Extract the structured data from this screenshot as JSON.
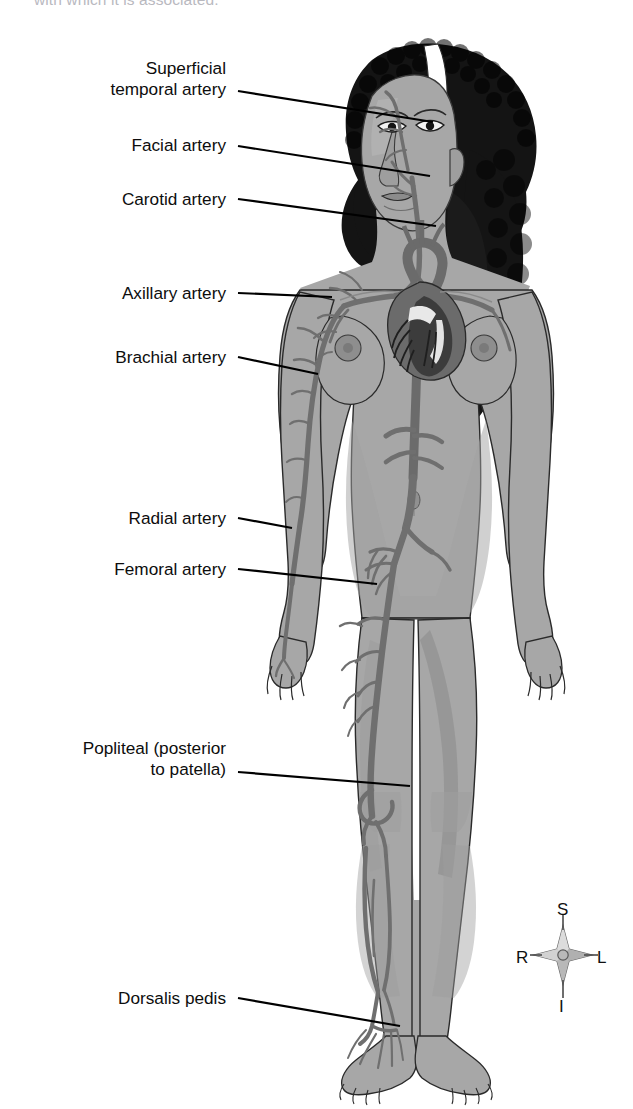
{
  "document": {
    "title": "Arterial pulse points of the body",
    "caption_fragment": "with which it is associated."
  },
  "figure": {
    "colors": {
      "background": "#ffffff",
      "skin": "#a7a7a7",
      "skin_shadow": "#8f8f8f",
      "skin_highlight": "#b6b6b6",
      "artery": "#6f6f6f",
      "artery_dark": "#5a5a5a",
      "hair": "#141414",
      "headband": "#ffffff",
      "heart": "#6b6b6b",
      "heart_dark": "#3c3c3c",
      "outline": "#1a1a1a",
      "leader_line": "#000000",
      "label_text": "#0d0d0d",
      "compass_fill": "#bdbdbd",
      "compass_stroke": "#5a5a5a"
    }
  },
  "labels": [
    {
      "id": "superficial-temporal-artery",
      "text": "Superficial\ntemporal artery",
      "align": "right",
      "x": 6,
      "y": 58,
      "width": 220,
      "leader": {
        "x1": 238,
        "y1": 91,
        "x2": 433,
        "y2": 122
      }
    },
    {
      "id": "facial-artery",
      "text": "Facial artery",
      "align": "right",
      "x": 6,
      "y": 135,
      "width": 220,
      "leader": {
        "x1": 238,
        "y1": 146,
        "x2": 430,
        "y2": 176
      }
    },
    {
      "id": "carotid-artery",
      "text": "Carotid artery",
      "align": "right",
      "x": 6,
      "y": 189,
      "width": 220,
      "leader": {
        "x1": 238,
        "y1": 199,
        "x2": 436,
        "y2": 226
      }
    },
    {
      "id": "axillary-artery",
      "text": "Axillary artery",
      "align": "right",
      "x": 6,
      "y": 283,
      "width": 220,
      "leader": {
        "x1": 238,
        "y1": 293,
        "x2": 330,
        "y2": 296
      }
    },
    {
      "id": "brachial-artery",
      "text": "Brachial artery",
      "align": "right",
      "x": 6,
      "y": 347,
      "width": 220,
      "leader": {
        "x1": 238,
        "y1": 357,
        "x2": 316,
        "y2": 374
      }
    },
    {
      "id": "radial-artery",
      "text": "Radial artery",
      "align": "right",
      "x": 6,
      "y": 508,
      "width": 220,
      "leader": {
        "x1": 238,
        "y1": 518,
        "x2": 290,
        "y2": 528
      }
    },
    {
      "id": "femoral-artery",
      "text": "Femoral artery",
      "align": "right",
      "x": 6,
      "y": 559,
      "width": 220,
      "leader": {
        "x1": 238,
        "y1": 569,
        "x2": 375,
        "y2": 584
      }
    },
    {
      "id": "popliteal-artery",
      "text": "Popliteal (posterior\nto patella)",
      "align": "right",
      "x": 6,
      "y": 738,
      "width": 220,
      "leader": {
        "x1": 238,
        "y1": 772,
        "x2": 408,
        "y2": 785
      }
    },
    {
      "id": "dorsalis-pedis",
      "text": "Dorsalis pedis",
      "align": "right",
      "x": 6,
      "y": 988,
      "width": 220,
      "leader": {
        "x1": 238,
        "y1": 998,
        "x2": 400,
        "y2": 1026
      }
    }
  ],
  "compass": {
    "name": "anatomical-orientation-compass",
    "superior": "S",
    "inferior": "I",
    "right": "R",
    "left": "L"
  }
}
